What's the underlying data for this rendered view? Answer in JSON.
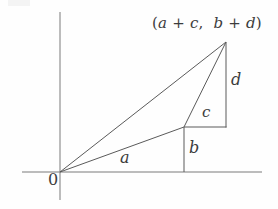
{
  "figure": {
    "background_color": "#fefefe",
    "stroke_color": "#555555",
    "text_color": "#3c3c3c",
    "axes": {
      "x_axis": {
        "label": "",
        "y": 172,
        "x_start": 22,
        "x_end": 262
      },
      "y_axis": {
        "label": "",
        "x": 60,
        "y_start": 12,
        "y_end": 200
      },
      "origin_label": "0"
    },
    "labels": {
      "a": "a",
      "b": "b",
      "c": "c",
      "d": "d",
      "point_open_paren": "(",
      "point_a": "a",
      "point_plus1": " + ",
      "point_c": "c",
      "point_comma": ",  ",
      "point_b": "b",
      "point_plus2": " + ",
      "point_d": "d",
      "point_close_paren": ")",
      "point_full": "(a + c,  b + d)"
    },
    "points": {
      "origin": {
        "name": "O",
        "x": 60,
        "y": 172
      },
      "mid_vertex": {
        "name": "(a, b)",
        "x": 184,
        "y": 127
      },
      "apex": {
        "name": "(a + c, b + d)",
        "x": 226,
        "y": 42
      },
      "rect_corner": {
        "name": "foot of d",
        "x": 226,
        "y": 127
      },
      "foot_of_b": {
        "name": "foot of b",
        "x": 184,
        "y": 172
      }
    },
    "segments": [
      {
        "name": "origin-to-apex",
        "x1": 60,
        "y1": 172,
        "x2": 226,
        "y2": 42
      },
      {
        "name": "origin-to-mid",
        "x1": 60,
        "y1": 172,
        "x2": 184,
        "y2": 127
      },
      {
        "name": "mid-to-apex",
        "x1": 184,
        "y1": 127,
        "x2": 226,
        "y2": 42
      },
      {
        "name": "b-vertical",
        "x1": 184,
        "y1": 127,
        "x2": 184,
        "y2": 172
      },
      {
        "name": "c-horizontal",
        "x1": 184,
        "y1": 127,
        "x2": 226,
        "y2": 127
      },
      {
        "name": "d-vertical",
        "x1": 226,
        "y1": 42,
        "x2": 226,
        "y2": 127
      }
    ]
  }
}
